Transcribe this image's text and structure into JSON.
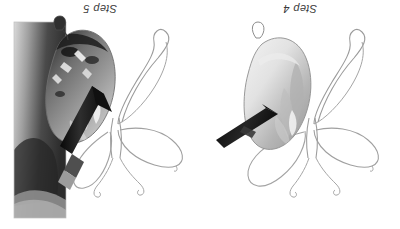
{
  "document": {
    "type": "photo-tutorial",
    "orientation": "rotated-180",
    "background_color": "#ffffff",
    "panel_count": 2
  },
  "panels": [
    {
      "id": "panel-left",
      "label": "Step 5",
      "label_color": "#3b3b3b",
      "subject": "butterfly watercolor sketch",
      "description": "Hand holding a paintbrush applying dark paint to the upper-left butterfly wing; wing is heavily shaded with dark gray and black washes. Remaining three wings and antennae are pencil outline only.",
      "brush": {
        "present": true,
        "handle_color": "#1a1a1a",
        "ferrule_color": "#9a9a9a"
      },
      "wing_fill_tone": "dark",
      "wing_fill_color": "#5a5a5a"
    },
    {
      "id": "panel-right",
      "label": "Step 4",
      "label_color": "#3b3b3b",
      "subject": "butterfly watercolor sketch",
      "description": "A brush tip touches the upper-left butterfly wing, laying down a first pale gray wash. The other wings and both antennae remain unpainted pencil outlines.",
      "brush": {
        "present": true,
        "handle_color": "#141414",
        "ferrule_color": "#8d8d8d"
      },
      "wing_fill_tone": "light",
      "wing_fill_color": "#bdbdbd"
    }
  ],
  "colors": {
    "paper": "#ffffff",
    "pencil_line": "#9a9a9a",
    "pencil_line_dark": "#6e6e6e",
    "paint_light": "#c9c9c9",
    "paint_mid": "#9e9e9e",
    "paint_dark": "#4c4c4c",
    "brush_handle": "#151515",
    "photo_shadow": "#3a3a3a",
    "label_text": "#3b3b3b"
  }
}
